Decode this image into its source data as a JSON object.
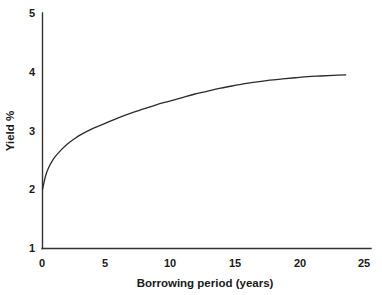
{
  "chart_data": {
    "type": "line",
    "title": "",
    "subtitle": "",
    "xlabel": "Borrowing period (years)",
    "ylabel": "Yield %",
    "xlim": [
      0,
      26
    ],
    "ylim": [
      1,
      5
    ],
    "xticks": [
      0,
      5,
      10,
      15,
      20,
      25
    ],
    "xtick_labels": [
      "0",
      "5",
      "10",
      "15",
      "20",
      "25"
    ],
    "yticks": [
      1,
      2,
      3,
      4,
      5
    ],
    "ytick_labels": [
      "1",
      "2",
      "3",
      "4",
      "5"
    ],
    "grid": false,
    "legend": null,
    "annotations": [],
    "series": [
      {
        "name": "Yield curve",
        "color": "#2b2b2b",
        "x": [
          0,
          0.25,
          0.5,
          0.75,
          1,
          1.5,
          2,
          2.5,
          3,
          4,
          5,
          6,
          7,
          8,
          9,
          10,
          11,
          12,
          13,
          14,
          15,
          16,
          17,
          18,
          19,
          20,
          21,
          22,
          23,
          24
        ],
        "y": [
          2.0,
          2.24,
          2.38,
          2.48,
          2.56,
          2.68,
          2.78,
          2.86,
          2.93,
          3.04,
          3.13,
          3.22,
          3.3,
          3.37,
          3.44,
          3.5,
          3.56,
          3.62,
          3.67,
          3.72,
          3.76,
          3.8,
          3.83,
          3.86,
          3.88,
          3.9,
          3.92,
          3.93,
          3.94,
          3.95
        ]
      }
    ]
  },
  "axes": {
    "y_axis_title": "Yield %",
    "x_axis_title": "Borrowing period (years)"
  },
  "colors": {
    "curve": "#2b2b2b",
    "axis": "#333333",
    "text": "#1a1a1a",
    "background": "#ffffff"
  }
}
